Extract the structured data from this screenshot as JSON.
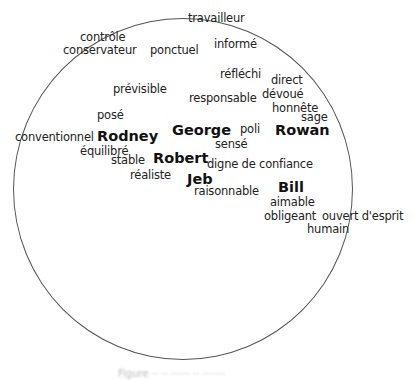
{
  "diagram": {
    "type": "trait-circle",
    "names": [
      {
        "id": "rodney",
        "label": "Rodney",
        "x": 97,
        "y": 129
      },
      {
        "id": "george",
        "label": "George",
        "x": 172,
        "y": 123
      },
      {
        "id": "robert",
        "label": "Robert",
        "x": 153,
        "y": 151
      },
      {
        "id": "jeb",
        "label": "Jeb",
        "x": 187,
        "y": 172
      },
      {
        "id": "rowan",
        "label": "Rowan",
        "x": 275,
        "y": 123
      },
      {
        "id": "bill",
        "label": "Bill",
        "x": 278,
        "y": 180
      }
    ],
    "traits": [
      {
        "label": "travailleur",
        "x": 188,
        "y": 13
      },
      {
        "label": "contrôle",
        "x": 80,
        "y": 32
      },
      {
        "label": "conservateur",
        "x": 63,
        "y": 45
      },
      {
        "label": "ponctuel",
        "x": 150,
        "y": 45
      },
      {
        "label": "informé",
        "x": 214,
        "y": 39
      },
      {
        "label": "prévisible",
        "x": 113,
        "y": 84
      },
      {
        "label": "réfléchi",
        "x": 220,
        "y": 69
      },
      {
        "label": "direct",
        "x": 271,
        "y": 75
      },
      {
        "label": "responsable",
        "x": 189,
        "y": 93
      },
      {
        "label": "dévoué",
        "x": 262,
        "y": 89
      },
      {
        "label": "honnête",
        "x": 272,
        "y": 103
      },
      {
        "label": "posé",
        "x": 97,
        "y": 110
      },
      {
        "label": "sage",
        "x": 301,
        "y": 112
      },
      {
        "label": "conventionnel",
        "x": 15,
        "y": 132
      },
      {
        "label": "poli",
        "x": 240,
        "y": 124
      },
      {
        "label": "équilibré",
        "x": 80,
        "y": 146
      },
      {
        "label": "sensé",
        "x": 215,
        "y": 139
      },
      {
        "label": "stable",
        "x": 111,
        "y": 155
      },
      {
        "label": "digne de confiance",
        "x": 207,
        "y": 159
      },
      {
        "label": "réaliste",
        "x": 130,
        "y": 170
      },
      {
        "label": "raisonnable",
        "x": 194,
        "y": 186
      },
      {
        "label": "aimable",
        "x": 270,
        "y": 197
      },
      {
        "label": "obligeant",
        "x": 264,
        "y": 211
      },
      {
        "label": "ouvert d'esprit",
        "x": 322,
        "y": 211
      },
      {
        "label": "humain",
        "x": 307,
        "y": 224
      }
    ]
  },
  "caption": "Figure ·· ·· ······ ·· ·······"
}
